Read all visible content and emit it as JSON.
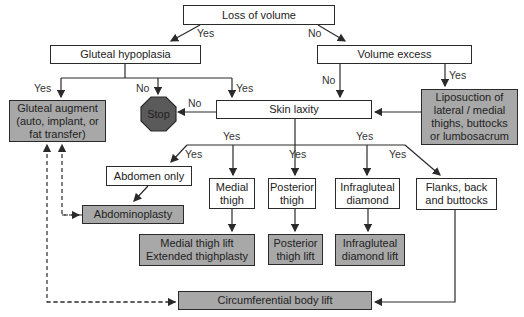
{
  "nodes": {
    "loss_of_volume": "Loss of volume",
    "gluteal_hypoplasia": "Gluteal hypoplasia",
    "volume_excess": "Volume excess",
    "gluteal_augment": "Gluteal augment\n(auto, implant, or\nfat transfer)",
    "stop": "Stop",
    "skin_laxity": "Skin laxity",
    "liposuction": "Liposuction of\nlateral / medial\nthighs, buttocks\nor lumbosacrum",
    "abdomen_only": "Abdomen only",
    "abdominoplasty": "Abdominoplasty",
    "medial_thigh": "Medial\nthigh",
    "posterior_thigh": "Posterior\nthigh",
    "infragluteal_diamond": "Infragluteal\ndiamond",
    "flanks": "Flanks, back\nand buttocks",
    "medial_thigh_lift": "Medial thigh lift\nExtended thighplasty",
    "posterior_thigh_lift": "Posterior\nthigh lift",
    "infragluteal_diamond_lift": "Infragluteal\ndiamond lift",
    "circumferential_body_lift": "Circumferential body lift"
  },
  "labels": {
    "loss_yes": "Yes",
    "loss_no": "No",
    "hypo_yes_left": "Yes",
    "hypo_no": "No",
    "hypo_yes_right": "Yes",
    "excess_no": "No",
    "excess_yes": "Yes",
    "laxity_no": "No",
    "laxity_yes_left": "Yes",
    "laxity_yes_right": "Yes",
    "abdomen_yes": "Yes",
    "posterior_yes": "Yes",
    "flanks_yes": "Yes"
  },
  "colors": {
    "action_fill": "#a8a8a8",
    "stop_fill": "#5a5a5a",
    "line": "#2a2a2a"
  }
}
